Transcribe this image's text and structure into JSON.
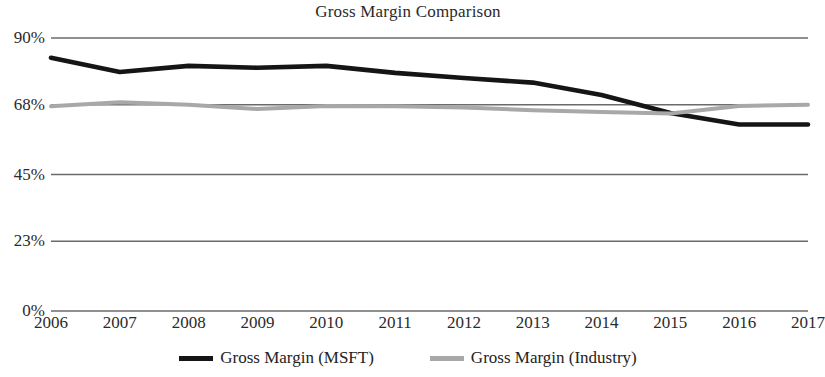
{
  "chart_data": {
    "type": "line",
    "title": "Gross Margin Comparison",
    "xlabel": "",
    "ylabel": "",
    "categories": [
      "2006",
      "2007",
      "2008",
      "2009",
      "2010",
      "2011",
      "2012",
      "2013",
      "2014",
      "2015",
      "2016",
      "2017"
    ],
    "series": [
      {
        "name": "Gross Margin (MSFT)",
        "color": "#151515",
        "values": [
          83.5,
          78.8,
          80.8,
          80.2,
          80.8,
          78.5,
          76.8,
          75.3,
          71.2,
          65.3,
          61.5,
          61.5
        ]
      },
      {
        "name": "Gross Margin (Industry)",
        "color": "#a8a8a8",
        "values": [
          67.5,
          68.8,
          68.0,
          66.6,
          67.6,
          67.5,
          67.1,
          66.2,
          65.6,
          65.1,
          67.6,
          68.0
        ]
      }
    ],
    "ylim": [
      0,
      90
    ],
    "y_ticks": [
      0,
      23,
      45,
      68,
      90
    ],
    "y_tick_labels": [
      "0%",
      "23%",
      "45%",
      "68%",
      "90%"
    ],
    "grid": true,
    "grid_axis": "y",
    "legend_position": "bottom",
    "axis_line_color": "#555555",
    "grid_color": "#6b6b6b",
    "background_color": "#ffffff"
  },
  "legend": {
    "entries": [
      {
        "label": "Gross Margin (MSFT)",
        "marker": "line-swatch-black"
      },
      {
        "label": "Gross Margin (Industry)",
        "marker": "line-swatch-gray"
      }
    ]
  }
}
